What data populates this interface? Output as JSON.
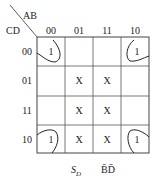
{
  "kmap": {
    "row_var": "CD",
    "col_var": "AB",
    "col_labels": [
      "00",
      "01",
      "11",
      "10"
    ],
    "row_labels": [
      "00",
      "01",
      "11",
      "10"
    ],
    "cells": [
      [
        "1",
        "",
        "",
        "1"
      ],
      [
        "",
        "X",
        "X",
        ""
      ],
      [
        "",
        "X",
        "X",
        ""
      ],
      [
        "1",
        "X",
        "X",
        "1"
      ]
    ],
    "footer": {
      "left_label": "S_D",
      "left_main": "S",
      "left_sub": "D",
      "right_label": "B̄D̄"
    }
  }
}
